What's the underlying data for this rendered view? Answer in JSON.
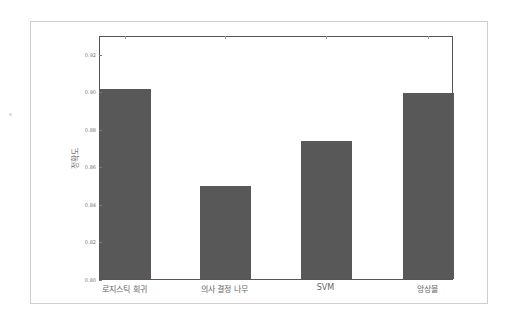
{
  "chart_data": {
    "type": "bar",
    "title": "",
    "xlabel": "",
    "ylabel": "정확도",
    "categories": [
      "로지스틱 회귀",
      "의사 결정 나무",
      "SVM",
      "앙상블"
    ],
    "values": [
      0.902,
      0.85,
      0.874,
      0.9
    ],
    "ylim": [
      0.8,
      0.93
    ],
    "yticks": [
      "0.80",
      "0.82",
      "0.84",
      "0.86",
      "0.88",
      "0.90",
      "0.92"
    ],
    "grid": false,
    "legend": null,
    "bar_color": "#585858"
  }
}
